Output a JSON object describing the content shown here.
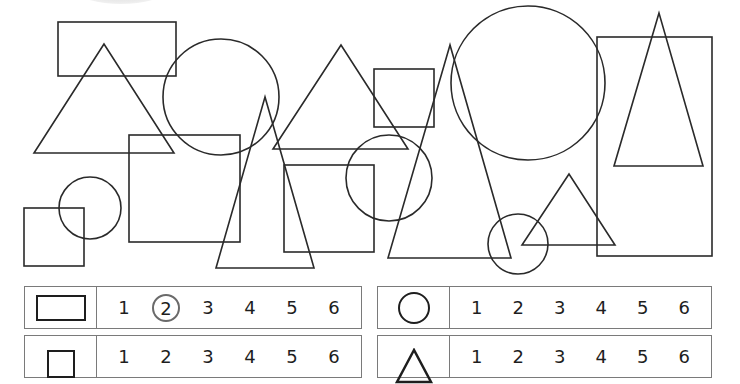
{
  "worksheet": {
    "task": "count-shapes",
    "shapes": {
      "rectangles": [
        {
          "x": 58,
          "y": 22,
          "w": 118,
          "h": 54
        },
        {
          "x": 597,
          "y": 37,
          "w": 115,
          "h": 219
        }
      ],
      "squares": [
        {
          "x": 129,
          "y": 135,
          "w": 111,
          "h": 107
        },
        {
          "x": 24,
          "y": 208,
          "w": 60,
          "h": 58
        },
        {
          "x": 284,
          "y": 165,
          "w": 90,
          "h": 87
        },
        {
          "x": 374,
          "y": 69,
          "w": 60,
          "h": 58
        }
      ],
      "circles": [
        {
          "cx": 221,
          "cy": 97,
          "r": 58
        },
        {
          "cx": 90,
          "cy": 208,
          "r": 31
        },
        {
          "cx": 389,
          "cy": 178,
          "r": 43
        },
        {
          "cx": 528,
          "cy": 83,
          "r": 77
        },
        {
          "cx": 518,
          "cy": 244,
          "r": 30
        }
      ],
      "triangles": [
        {
          "points": "104,44 34,153 174,153"
        },
        {
          "points": "265,97 216,268 314,268"
        },
        {
          "points": "341,45 273,149 408,149"
        },
        {
          "points": "450,45 388,258 511,258"
        },
        {
          "points": "569,174 522,245 615,245"
        },
        {
          "points": "659,13 614,166 703,166"
        }
      ]
    },
    "answer_rows": [
      {
        "shape": "rectangle",
        "options": [
          "1",
          "2",
          "3",
          "4",
          "5",
          "6"
        ],
        "selected": "2"
      },
      {
        "shape": "circle",
        "options": [
          "1",
          "2",
          "3",
          "4",
          "5",
          "6"
        ],
        "selected": null
      },
      {
        "shape": "square",
        "options": [
          "1",
          "2",
          "3",
          "4",
          "5",
          "6"
        ],
        "selected": null
      },
      {
        "shape": "triangle",
        "options": [
          "1",
          "2",
          "3",
          "4",
          "5",
          "6"
        ],
        "selected": null
      }
    ],
    "colors": {
      "stroke": "#2a2a2a",
      "table_border": "#7a7a7a",
      "circled_answer": "#6a6a6a"
    }
  }
}
